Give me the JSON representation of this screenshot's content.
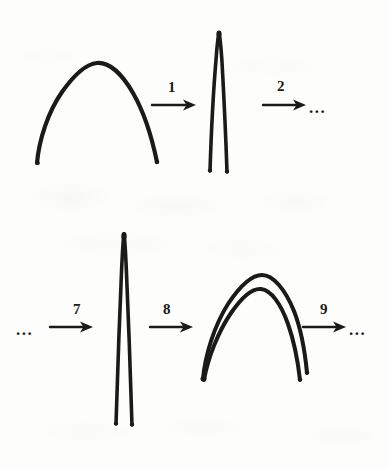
{
  "figure": {
    "ink_color": "#1a1a1a",
    "background_color": "#fdfdfc",
    "rows": [
      {
        "id": "row-top",
        "items": [
          {
            "kind": "shape",
            "name": "wide-arch-curve",
            "description": "single wide arch curve"
          },
          {
            "kind": "arrow",
            "name": "step-arrow-1",
            "label": "1"
          },
          {
            "kind": "shape",
            "name": "narrow-spike-curve",
            "description": "single narrow tall spike curve"
          },
          {
            "kind": "arrow",
            "name": "step-arrow-2",
            "label": "2"
          },
          {
            "kind": "ellipsis",
            "name": "trailing-ellipsis-top",
            "label": "..."
          }
        ]
      },
      {
        "id": "row-bottom",
        "items": [
          {
            "kind": "ellipsis",
            "name": "leading-ellipsis-bottom",
            "label": "..."
          },
          {
            "kind": "arrow",
            "name": "step-arrow-7",
            "label": "7"
          },
          {
            "kind": "shape",
            "name": "narrow-spike-curve-tall",
            "description": "single narrow very tall spike curve"
          },
          {
            "kind": "arrow",
            "name": "step-arrow-8",
            "label": "8"
          },
          {
            "kind": "shape",
            "name": "double-arch-curve",
            "description": "doubled parallel arch curves"
          },
          {
            "kind": "arrow",
            "name": "step-arrow-9",
            "label": "9"
          },
          {
            "kind": "ellipsis",
            "name": "trailing-ellipsis-bottom",
            "label": "..."
          }
        ]
      }
    ],
    "step_labels": {
      "s1": "1",
      "s2": "2",
      "s7": "7",
      "s8": "8",
      "s9": "9"
    },
    "ellipses": {
      "top_right": "...",
      "bottom_left": "...",
      "bottom_right": "..."
    }
  }
}
